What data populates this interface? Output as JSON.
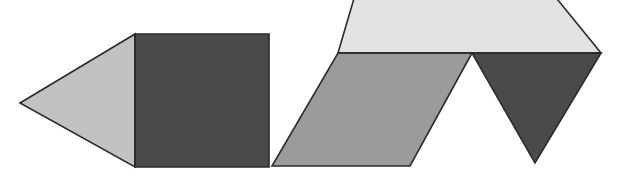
{
  "figure": {
    "width": 617,
    "height": 176,
    "background_color": "#ffffff",
    "outline_color": "#2b2b2b",
    "outline_width": 1.6
  },
  "palette": {
    "light": "#e2e2e2",
    "light_medium": "#c2c2c2",
    "medium": "#9b9b9b",
    "dark": "#4a4a4a",
    "outline": "#2b2b2b",
    "background": "#ffffff"
  },
  "shapes": [
    {
      "id": "left-triangle",
      "name": "left-pointing-triangle",
      "kind": "triangle",
      "fill": "#c2c2c2",
      "points": "20,103 135,34 135,167",
      "vertex_count": 3
    },
    {
      "id": "center-square",
      "name": "dark-square",
      "kind": "square",
      "fill": "#4a4a4a",
      "points": "135,34 269,34 269,167 135,167",
      "vertex_count": 4
    },
    {
      "id": "parallelogram",
      "name": "medium-gray-parallelogram",
      "kind": "parallelogram",
      "fill": "#9b9b9b",
      "points": "338,53 472,53 410,166 272,166",
      "vertex_count": 4
    },
    {
      "id": "top-trapezoid",
      "name": "light-top-trapezoid",
      "kind": "trapezoid",
      "fill": "#e2e2e2",
      "points": "338,53 601,53 540,-22 360,-22",
      "vertex_count": 4
    },
    {
      "id": "right-triangle",
      "name": "dark-inverted-triangle",
      "kind": "triangle",
      "fill": "#4a4a4a",
      "points": "472,53 601,53 535,163",
      "vertex_count": 3
    }
  ],
  "edges": [
    {
      "id": "divider-horizontal",
      "name": "horizontal-divider-line",
      "from": [
        338,
        53
      ],
      "to": [
        601,
        53
      ]
    },
    {
      "id": "divider-square-left",
      "name": "square-left-edge",
      "from": [
        135,
        34
      ],
      "to": [
        135,
        167
      ]
    }
  ],
  "notes": {
    "shape_count": "5",
    "notch_label": "white V notch between parallelogram and dark triangle"
  }
}
